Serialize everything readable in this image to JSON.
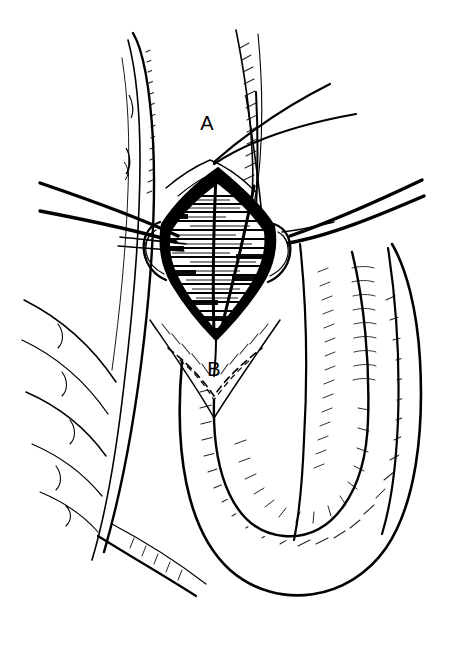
{
  "figure": {
    "domain": "Natural-Image",
    "kind": "line-art-medical-illustration",
    "background_color": "#ffffff",
    "ink_color": "#000000",
    "width": 458,
    "height": 645
  },
  "labels": [
    {
      "id": "label-a",
      "text": "A",
      "x": 207,
      "y": 130,
      "describes": "apex of incision, superior pole"
    },
    {
      "id": "label-b",
      "text": "B",
      "x": 214,
      "y": 376,
      "describes": "apex of incision, inferior pole"
    }
  ],
  "annotations": {
    "incision_shape": "diamond",
    "incision_fill": "horizontal-hatch",
    "incision_border": "solid-black-thick",
    "dashed_incision_line": "V-shaped dashed guide below B",
    "suture_threads_left": 2,
    "suture_threads_right": 2,
    "retractor_hooks": 2,
    "lower_structure": "U-shaped hatched anatomical loop",
    "hatching_style": "fine-stipple-and-dash"
  }
}
